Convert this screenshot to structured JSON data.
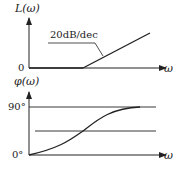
{
  "magnitude_plot": {
    "y_label": "L(ω)",
    "x_label": "ω",
    "origin_label": "0",
    "slope_annotation": "20dB/dec"
  },
  "phase_plot": {
    "y_label": "φ(ω)",
    "x_label": "ω",
    "tick_top": "90°",
    "tick_bottom": "0°"
  },
  "colors": {
    "line": "#222222",
    "background": "#ffffff"
  }
}
